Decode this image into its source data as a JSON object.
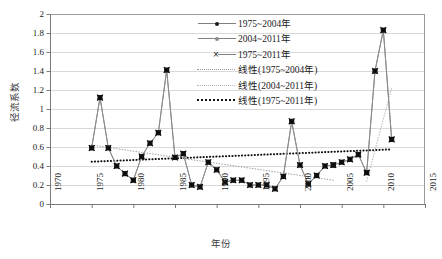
{
  "chart_data": {
    "type": "line",
    "title": "",
    "xlabel": "年份",
    "ylabel": "径流系数",
    "xlim": [
      1970,
      2015
    ],
    "ylim": [
      0,
      2
    ],
    "xticks": [
      1970,
      1975,
      1980,
      1985,
      1990,
      1995,
      2000,
      2005,
      2010,
      2015
    ],
    "yticks": [
      "0",
      "0.2",
      "0.4",
      "0.6",
      "0.8",
      "1",
      "1.2",
      "1.4",
      "1.6",
      "1.8",
      "2"
    ],
    "grid": "horizontal",
    "legend_position": "upper-right-inside",
    "series": [
      {
        "name": "1975~2004年",
        "marker": "filled-square-dot",
        "x": [
          1975,
          1976,
          1977,
          1978,
          1979,
          1980,
          1981,
          1982,
          1983,
          1984,
          1985,
          1986,
          1987,
          1988,
          1989,
          1990,
          1991,
          1992,
          1993,
          1994,
          1995,
          1996,
          1997,
          1998,
          1999,
          2000,
          2001,
          2002,
          2003,
          2004
        ],
        "values": [
          0.59,
          1.12,
          0.59,
          0.4,
          0.32,
          0.25,
          0.5,
          0.64,
          0.75,
          1.41,
          0.49,
          0.53,
          0.2,
          0.18,
          0.44,
          0.36,
          0.23,
          0.25,
          0.25,
          0.2,
          0.2,
          0.2,
          0.16,
          0.29,
          0.87,
          0.41,
          0.21,
          0.3,
          0.4,
          0.41
        ]
      },
      {
        "name": "2004~2011年",
        "marker": "filled-square-dot",
        "x": [
          2004,
          2005,
          2006,
          2007,
          2008,
          2009,
          2010,
          2011
        ],
        "values": [
          0.41,
          0.44,
          0.47,
          0.52,
          0.33,
          1.4,
          1.83,
          0.68
        ]
      },
      {
        "name": "1975~2011年",
        "marker": "x",
        "x": [
          1975,
          1976,
          1977,
          1978,
          1979,
          1980,
          1981,
          1982,
          1983,
          1984,
          1985,
          1986,
          1987,
          1988,
          1989,
          1990,
          1991,
          1992,
          1993,
          1994,
          1995,
          1996,
          1997,
          1998,
          1999,
          2000,
          2001,
          2002,
          2003,
          2004,
          2005,
          2006,
          2007,
          2008,
          2009,
          2010,
          2011
        ],
        "values": [
          0.59,
          1.12,
          0.59,
          0.4,
          0.32,
          0.25,
          0.5,
          0.64,
          0.75,
          1.41,
          0.49,
          0.53,
          0.2,
          0.18,
          0.44,
          0.36,
          0.23,
          0.25,
          0.25,
          0.2,
          0.2,
          0.2,
          0.16,
          0.29,
          0.87,
          0.41,
          0.21,
          0.3,
          0.4,
          0.41,
          0.44,
          0.47,
          0.52,
          0.33,
          1.4,
          1.83,
          0.68
        ]
      }
    ],
    "trendlines": [
      {
        "name": "线性(1975~2004年)",
        "style": "fine-dotted",
        "color": "#9a9a9a",
        "x": [
          1975,
          2004
        ],
        "y": [
          0.62,
          0.25
        ]
      },
      {
        "name": "线性(2004~2011年)",
        "style": "fine-dotted",
        "color": "#b0b0b0",
        "x": [
          2008,
          2011
        ],
        "y": [
          0.24,
          1.22
        ]
      },
      {
        "name": "线性(1975~2011年)",
        "style": "bold-dotted",
        "color": "#111111",
        "x": [
          1975,
          2011
        ],
        "y": [
          0.445,
          0.575
        ]
      }
    ]
  },
  "legend": {
    "items": [
      {
        "label": "1975~2004年",
        "key": "line-dot-dark"
      },
      {
        "label": "2004~2011年",
        "key": "line-dot-gray"
      },
      {
        "label": "1975~2011年",
        "key": "x-marker"
      },
      {
        "label": "线性(1975~2004年)",
        "key": "dotted-fine"
      },
      {
        "label": "线性(2004~2011年)",
        "key": "dotted-fine-light"
      },
      {
        "label": "线性(1975~2011年)",
        "key": "dotted-bold"
      }
    ]
  },
  "axes": {
    "y_title": "径流系数",
    "x_title": "年份",
    "y_ticks": [
      "2",
      "1.8",
      "1.6",
      "1.4",
      "1.2",
      "1",
      "0.8",
      "0.6",
      "0.4",
      "0.2",
      "0"
    ],
    "x_ticks": [
      "1970",
      "1975",
      "1980",
      "1985",
      "1990",
      "1995",
      "2000",
      "2005",
      "2010",
      "2015"
    ]
  },
  "colors": {
    "grid": "#d9d9d9",
    "axis": "#808080",
    "series_line": "#8c8c8c",
    "marker": "#141414",
    "trend_bold": "#111111",
    "trend_fine": "#9a9a9a"
  }
}
